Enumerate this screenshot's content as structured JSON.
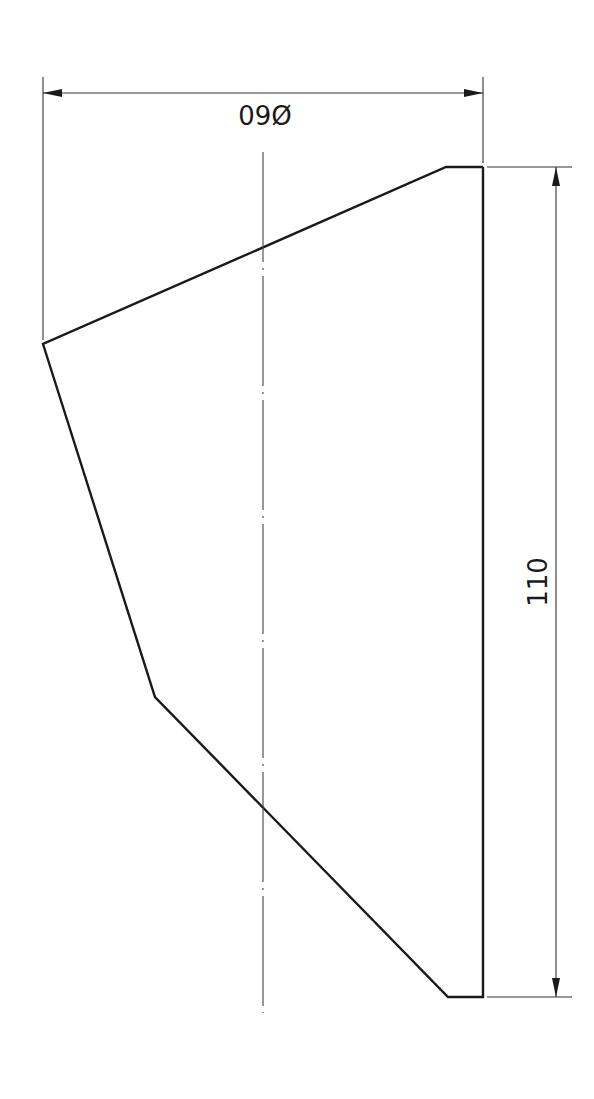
{
  "drawing": {
    "type": "technical-drawing",
    "view": "rotated part profile with centerline",
    "dimensions": {
      "diameter": {
        "label": "Ø60",
        "rendered_text": "Ø60",
        "orientation": "rotated 180°"
      },
      "height": {
        "label": "110",
        "rendered_text": "110",
        "orientation": "rotated -90°"
      }
    },
    "colors": {
      "line": "#1a1a1a",
      "background": "#ffffff"
    }
  }
}
